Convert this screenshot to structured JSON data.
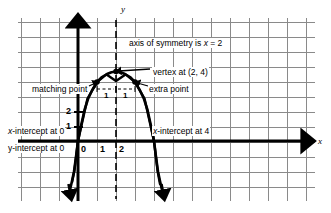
{
  "figure": {
    "kind": "coordinate-graph",
    "background_color": "#ffffff",
    "ink_color": "#000000",
    "grid_color": "#8a8a8a"
  },
  "axes": {
    "x_axis_name": "x",
    "y_axis_name": "y",
    "x_ticks": [
      "0",
      "1",
      "2"
    ],
    "y_ticks": [
      "1",
      "2"
    ]
  },
  "annotations": {
    "axis_of_symmetry": "axis of symmetry is x = 2",
    "vertex": "vertex at (2, 4)",
    "matching_point": "matching point",
    "extra_point": "extra point",
    "x_intercept_left": "x-intercept at 0",
    "x_intercept_right": "x-intercept at 4",
    "y_intercept": "y-intercept at 0",
    "unit_left": "1",
    "unit_right": "1"
  },
  "chart_data": {
    "type": "line",
    "title": "",
    "xlabel": "x",
    "ylabel": "y",
    "grid": true,
    "legend": "none",
    "xlim": [
      -3.2,
      12.5
    ],
    "ylim": [
      -4.0,
      8.2
    ],
    "curve": {
      "name": "parabola",
      "equation": "y = -x^2 + 4x",
      "vertex": [
        2,
        4
      ],
      "axis_of_symmetry": 2,
      "opens": "down",
      "x_intercepts": [
        0,
        4
      ],
      "y_intercept": 0
    },
    "marked_points": [
      {
        "label": "matching point",
        "x": 1,
        "y": 3
      },
      {
        "label": "vertex",
        "x": 2,
        "y": 4
      },
      {
        "label": "extra point",
        "x": 3,
        "y": 3
      }
    ]
  }
}
